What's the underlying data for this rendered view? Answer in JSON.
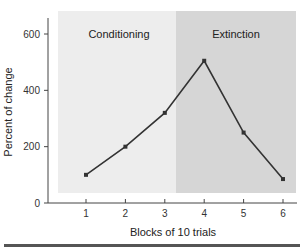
{
  "chart_data": {
    "type": "line",
    "title": "",
    "xlabel": "Blocks of 10 trials",
    "ylabel": "Percent of change",
    "x": [
      1,
      2,
      3,
      4,
      5,
      6
    ],
    "x_tick_labels": [
      "1",
      "2",
      "3",
      "4",
      "5",
      "6"
    ],
    "y_tick_labels": [
      "0",
      "200",
      "400",
      "600"
    ],
    "y_ticks": [
      0,
      200,
      400,
      600
    ],
    "ylim": [
      0,
      650
    ],
    "grid": false,
    "legend": null,
    "series": [
      {
        "name": "Percent of change",
        "values": [
          100,
          200,
          320,
          505,
          250,
          85
        ]
      }
    ],
    "regions": [
      {
        "label": "Conditioning",
        "x_range": [
          0.7,
          3.3
        ],
        "color": "#eeeeee"
      },
      {
        "label": "Extinction",
        "x_range": [
          3.3,
          6.35
        ],
        "color": "#d8d8d8"
      }
    ],
    "annotations": [
      "Conditioning",
      "Extinction"
    ]
  },
  "colors": {
    "conditioning_bg": "#ededed",
    "extinction_bg": "#d6d6d6",
    "line": "#333333",
    "axis": "#444444",
    "bottom_rule": "#555555"
  }
}
